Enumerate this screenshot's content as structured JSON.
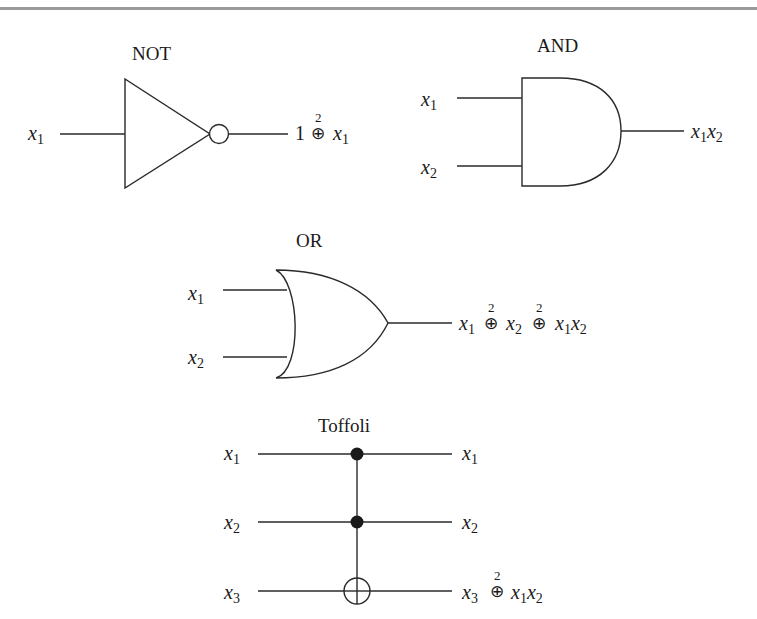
{
  "gates": {
    "not": {
      "title": "NOT",
      "input": {
        "var": "x",
        "sub": "1"
      },
      "output": {
        "lead": "1",
        "op": "⊕",
        "op_sup": "2",
        "var": "x",
        "sub": "1"
      }
    },
    "and": {
      "title": "AND",
      "inputs": [
        {
          "var": "x",
          "sub": "1"
        },
        {
          "var": "x",
          "sub": "2"
        }
      ],
      "output": {
        "var1": "x",
        "sub1": "1",
        "var2": "x",
        "sub2": "2"
      }
    },
    "or": {
      "title": "OR",
      "inputs": [
        {
          "var": "x",
          "sub": "1"
        },
        {
          "var": "x",
          "sub": "2"
        }
      ],
      "output": {
        "t1_var": "x",
        "t1_sub": "1",
        "op1": "⊕",
        "op1_sup": "2",
        "t2_var": "x",
        "t2_sub": "2",
        "op2": "⊕",
        "op2_sup": "2",
        "t3_var1": "x",
        "t3_sub1": "1",
        "t3_var2": "x",
        "t3_sub2": "2"
      }
    },
    "toffoli": {
      "title": "Toffoli",
      "inputs": [
        {
          "var": "x",
          "sub": "1"
        },
        {
          "var": "x",
          "sub": "2"
        },
        {
          "var": "x",
          "sub": "3"
        }
      ],
      "outputs": [
        {
          "var": "x",
          "sub": "1"
        },
        {
          "var": "x",
          "sub": "2"
        },
        {
          "var": "x",
          "sub": "3",
          "op": "⊕",
          "op_sup": "2",
          "var1": "x",
          "sub1": "1",
          "var2": "x",
          "sub2": "2"
        }
      ]
    }
  },
  "colors": {
    "line": "#2a2a2a",
    "rule": "#9a9a9a",
    "background": "#ffffff"
  }
}
